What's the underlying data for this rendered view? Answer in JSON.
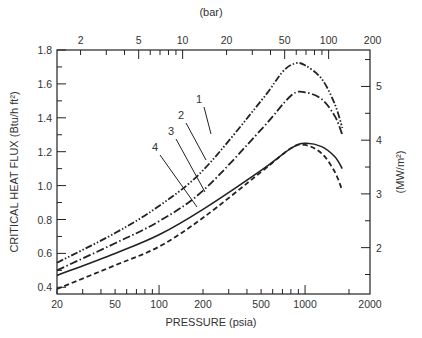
{
  "chart_data": {
    "type": "line",
    "title": "",
    "xlabel": "PRESSURE (psia)",
    "ylabel": "CRITICAL HEAT FLUX (Btu/h ft²)",
    "y2label": "(MW/m²)",
    "x2label": "(bar)",
    "xscale": "log",
    "xlim": [
      20,
      2900
    ],
    "ylim": [
      0.35,
      1.8
    ],
    "grid": false,
    "x_ticks": [
      20,
      50,
      100,
      200,
      500,
      1000,
      2000
    ],
    "x_tick_labels": [
      "20",
      "50",
      "100",
      "200",
      "500",
      "1000",
      "2000"
    ],
    "y_ticks": [
      0.4,
      0.6,
      0.8,
      1.0,
      1.2,
      1.4,
      1.6,
      1.8
    ],
    "y_tick_labels": [
      "0.4",
      "0.6",
      "0.8",
      "1.0",
      "1.2",
      "1.4",
      "1.6",
      "1.8"
    ],
    "x2_ticks_bar": [
      2,
      5,
      10,
      20,
      50,
      100,
      200
    ],
    "x2_tick_labels": [
      "2",
      "5",
      "10",
      "20",
      "50",
      "100",
      "200"
    ],
    "y2_ticks_mw": [
      2,
      3,
      4,
      5
    ],
    "y2_tick_labels": [
      "2",
      "3",
      "4",
      "5"
    ],
    "series": [
      {
        "name": "1",
        "style": "dash-dot-dot",
        "x": [
          20,
          50,
          100,
          200,
          500,
          700,
          850,
          1000,
          1300,
          1600,
          1800
        ],
        "values": [
          0.545,
          0.72,
          0.88,
          1.09,
          1.5,
          1.67,
          1.72,
          1.71,
          1.63,
          1.48,
          1.34
        ]
      },
      {
        "name": "2",
        "style": "dash-dot",
        "x": [
          20,
          50,
          100,
          200,
          500,
          800,
          1000,
          1300,
          1600,
          1800
        ],
        "values": [
          0.5,
          0.66,
          0.79,
          0.97,
          1.33,
          1.53,
          1.55,
          1.51,
          1.41,
          1.3
        ]
      },
      {
        "name": "3",
        "style": "solid",
        "x": [
          20,
          50,
          100,
          200,
          500,
          800,
          1000,
          1300,
          1600,
          1800
        ],
        "values": [
          0.47,
          0.6,
          0.71,
          0.86,
          1.09,
          1.22,
          1.25,
          1.23,
          1.17,
          1.1
        ]
      },
      {
        "name": "4",
        "style": "dashed",
        "x": [
          20,
          50,
          100,
          200,
          500,
          800,
          1000,
          1300,
          1600,
          1800
        ],
        "values": [
          0.39,
          0.53,
          0.64,
          0.81,
          1.08,
          1.22,
          1.24,
          1.19,
          1.08,
          0.97
        ]
      }
    ],
    "annotations": [
      {
        "label": "1",
        "x": 200,
        "y": 1.09
      },
      {
        "label": "2",
        "x": 205,
        "y": 0.97
      },
      {
        "label": "3",
        "x": 215,
        "y": 0.86
      },
      {
        "label": "4",
        "x": 200,
        "y": 0.78
      }
    ]
  },
  "labels": {
    "x_axis": "PRESSURE (psia)",
    "y_axis": "CRITICAL HEAT FLUX (Btu/h ft²)",
    "y2_axis": "(MW/m²)",
    "x2_axis": "(bar)"
  },
  "colors": {
    "ink": "#222222",
    "background": "#ffffff"
  }
}
